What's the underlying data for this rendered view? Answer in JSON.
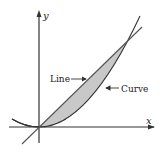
{
  "diagram": {
    "axes": {
      "x_label": "x",
      "y_label": "y"
    },
    "labels": {
      "line": "Line",
      "curve": "Curve"
    },
    "colors": {
      "stroke": "#333333",
      "fill": "#c8c8c8",
      "text": "#222222"
    }
  }
}
